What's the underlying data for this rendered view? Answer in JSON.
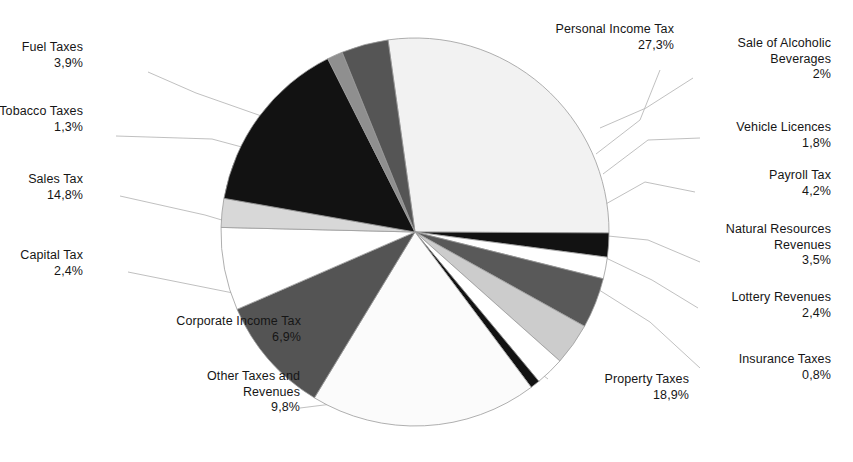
{
  "chart_data": {
    "type": "pie",
    "title": "",
    "subtitle": "",
    "xlabel": "",
    "ylabel": "",
    "legend_position": "callout-labels",
    "grid": false,
    "value_suffix": "%",
    "decimal_separator": ",",
    "start_angle_deg": -8,
    "direction": "clockwise",
    "categories": [
      "Personal Income Tax",
      "Sale of Alcoholic Beverages",
      "Vehicle Licences",
      "Payroll Tax",
      "Natural Resources Revenues",
      "Lottery Revenues",
      "Insurance Taxes",
      "Property Taxes",
      "Other Taxes and Revenues",
      "Corporate Income Tax",
      "Capital Tax",
      "Sales Tax",
      "Tobacco Taxes",
      "Fuel Taxes"
    ],
    "values": [
      27.3,
      2.0,
      1.8,
      4.2,
      3.5,
      2.4,
      0.8,
      18.9,
      9.8,
      6.9,
      2.4,
      14.8,
      1.3,
      3.9
    ],
    "labels": [
      "27,3%",
      "2%",
      "1,8%",
      "4,2%",
      "3,5%",
      "2,4%",
      "0,8%",
      "18,9%",
      "9,8%",
      "6,9%",
      "2,4%",
      "14,8%",
      "1,3%",
      "3,9%"
    ],
    "slice_colors": [
      "#f2f2f2",
      "#121212",
      "#ffffff",
      "#595959",
      "#cccccc",
      "#ffffff",
      "#121212",
      "#fbfbfb",
      "#545454",
      "#ffffff",
      "#d8d8d8",
      "#121212",
      "#8f8f8f",
      "#555555"
    ]
  },
  "labels": {
    "personal_income_tax": {
      "name": "Personal Income Tax",
      "pct": "27,3%"
    },
    "sale_of_alcoholic": {
      "line1": "Sale of Alcoholic",
      "line2": "Beverages",
      "pct": "2%"
    },
    "vehicle_licences": {
      "name": "Vehicle Licences",
      "pct": "1,8%"
    },
    "payroll_tax": {
      "name": "Payroll Tax",
      "pct": "4,2%"
    },
    "natural_resources": {
      "line1": "Natural Resources",
      "line2": "Revenues",
      "pct": "3,5%"
    },
    "lottery_revenues": {
      "name": "Lottery Revenues",
      "pct": "2,4%"
    },
    "insurance_taxes": {
      "name": "Insurance Taxes",
      "pct": "0,8%"
    },
    "property_taxes": {
      "name": "Property  Taxes",
      "pct": "18,9%"
    },
    "other_taxes_and_revenues": {
      "line1": "Other Taxes and",
      "line2": "Revenues",
      "pct": "9,8%"
    },
    "corporate_income_tax": {
      "name": "Corporate Income Tax",
      "pct": "6,9%"
    },
    "capital_tax": {
      "name": "Capital Tax",
      "pct": "2,4%"
    },
    "sales_tax": {
      "name": "Sales Tax",
      "pct": "14,8%"
    },
    "tobacco_taxes": {
      "name": "Tobacco Taxes",
      "pct": "1,3%"
    },
    "fuel_taxes": {
      "name": "Fuel Taxes",
      "pct": "3,9%"
    }
  },
  "colors": {
    "background": "#ffffff",
    "text": "#161616",
    "leader_line": "#b9b9b9",
    "slice_outline": "#9a9a9a"
  }
}
